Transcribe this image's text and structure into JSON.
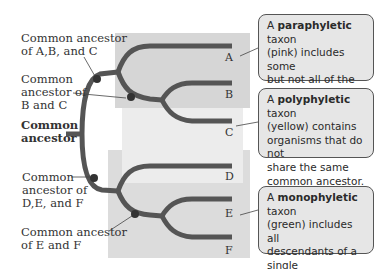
{
  "diagram": {
    "type": "cladogram",
    "line_color": "#555555",
    "regions": [
      {
        "name": "paraphyletic",
        "color_name": "pink",
        "fill": "#d6d6d6"
      },
      {
        "name": "polyphyletic",
        "color_name": "yellow",
        "fill": "#ececec"
      },
      {
        "name": "monophyletic",
        "color_name": "green",
        "fill": "#dcdcdc"
      }
    ],
    "leaves": [
      "A",
      "B",
      "C",
      "D",
      "E",
      "F"
    ],
    "node_labels": {
      "abc": [
        "Common ancestor",
        "of A,B, and C"
      ],
      "bc": [
        "Common",
        "ancestor of",
        "B and C"
      ],
      "root": [
        "Common",
        "ancestor"
      ],
      "def": [
        "Common",
        "ancestor of",
        "D,E, and F"
      ],
      "ef": [
        "Common ancestor",
        "of E and F"
      ]
    },
    "callouts": {
      "paraphyletic": {
        "prefix": "A ",
        "term": "paraphyletic",
        "lines": [
          " taxon",
          "(pink) includes some",
          "but not all of the de-",
          "scendants of a single",
          "ancestor."
        ]
      },
      "polyphyletic": {
        "prefix": "A ",
        "term": "polyphyletic",
        "lines": [
          " taxon",
          "(yellow) contains",
          "organisms that do not",
          "share the same",
          "common ancestor."
        ]
      },
      "monophyletic": {
        "prefix": "A ",
        "term": "monophyletic",
        "lines": [
          " taxon",
          "(green) includes all",
          "descendants of a single",
          "ancestor and no other",
          "organism."
        ]
      }
    }
  }
}
